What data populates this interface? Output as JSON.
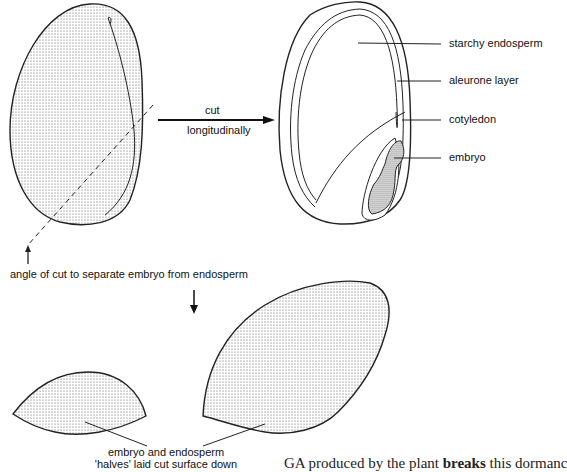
{
  "figure": {
    "step1": {
      "arrow_label_top": "cut",
      "arrow_label_bottom": "longitudinally"
    },
    "cut_annotation": "angle of cut to separate embryo from endosperm",
    "labels": {
      "starchy_endosperm": "starchy endosperm",
      "aleurone_layer": "aleurone layer",
      "cotyledon": "cotyledon",
      "embryo": "embryo"
    },
    "halves_caption": {
      "line1": "embryo and endosperm",
      "line2": "'halves' laid cut surface down"
    }
  },
  "body_text": {
    "prefix": "GA produced by the plant ",
    "bold": "breaks",
    "suffix": " this dormanc"
  }
}
